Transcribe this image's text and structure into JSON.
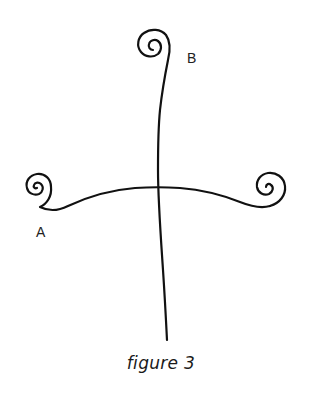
{
  "figure": {
    "caption": "figure 3",
    "labels": {
      "top_spiral": "B",
      "left_spiral": "A"
    },
    "stroke_color": "#111111",
    "background_color": "#ffffff",
    "elements": [
      {
        "name": "vertical-stem",
        "description": "Vertical stem with spiral at top (B)"
      },
      {
        "name": "horizontal-arm",
        "description": "Curved horizontal arm with spirals at both ends (A on left)"
      }
    ]
  }
}
